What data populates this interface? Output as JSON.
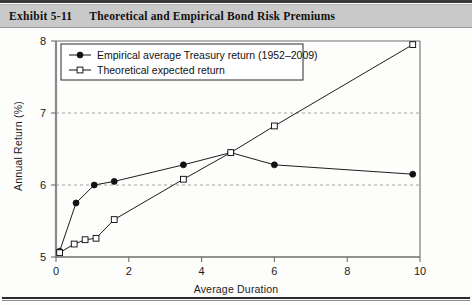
{
  "header": {
    "exhibit_label": "Exhibit 5-11",
    "title": "Theoretical and Empirical Bond Risk Premiums"
  },
  "chart_data": {
    "type": "line",
    "title": "Theoretical and Empirical Bond Risk Premiums",
    "xlabel": "Average Duration",
    "ylabel": "Annual Return (%)",
    "xlim": [
      0,
      10
    ],
    "ylim": [
      5,
      8
    ],
    "xticks": [
      0,
      2,
      4,
      6,
      8,
      10
    ],
    "yticks": [
      5,
      6,
      7,
      8
    ],
    "xtick_labels": [
      "0",
      "2",
      "4",
      "6",
      "8",
      "10"
    ],
    "ytick_labels": [
      "5",
      "6",
      "7",
      "8"
    ],
    "grid": "horizontal-dashed",
    "gridlines_y": [
      6,
      7
    ],
    "legend_position": "top-left",
    "series": [
      {
        "name": "Empirical average Treasury return (1952–2009)",
        "marker": "filled-circle",
        "color": "#111111",
        "points": [
          {
            "x": 0.1,
            "y": 5.08
          },
          {
            "x": 0.55,
            "y": 5.75
          },
          {
            "x": 1.05,
            "y": 6.0
          },
          {
            "x": 1.6,
            "y": 6.05
          },
          {
            "x": 3.5,
            "y": 6.28
          },
          {
            "x": 4.8,
            "y": 6.45
          },
          {
            "x": 6.0,
            "y": 6.28
          },
          {
            "x": 9.8,
            "y": 6.15
          }
        ]
      },
      {
        "name": "Theoretical expected return",
        "marker": "open-square",
        "color": "#111111",
        "points": [
          {
            "x": 0.1,
            "y": 5.06
          },
          {
            "x": 0.5,
            "y": 5.18
          },
          {
            "x": 0.8,
            "y": 5.24
          },
          {
            "x": 1.1,
            "y": 5.26
          },
          {
            "x": 1.6,
            "y": 5.52
          },
          {
            "x": 3.5,
            "y": 6.08
          },
          {
            "x": 4.8,
            "y": 6.45
          },
          {
            "x": 6.0,
            "y": 6.82
          },
          {
            "x": 9.8,
            "y": 7.95
          }
        ]
      }
    ]
  }
}
